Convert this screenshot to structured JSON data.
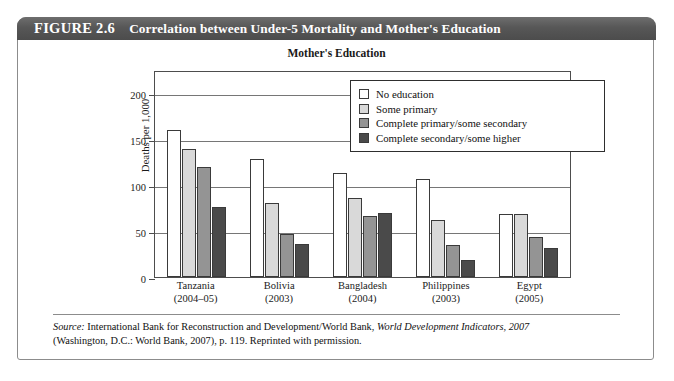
{
  "figure": {
    "label": "FIGURE 2.6",
    "title": "Correlation between Under-5 Mortality and Mother's Education"
  },
  "source": {
    "prefix": "Source:",
    "line1_a": " International Bank for Reconstruction and Development/World Bank, ",
    "line1_italic": "World Development Indicators, 2007",
    "line2": "(Washington, D.C.: World Bank, 2007), p. 119. Reprinted with permission."
  },
  "colors": {
    "header_bar": "#575757",
    "series_no_education": "#ffffff",
    "series_some_primary": "#d9d9d9",
    "series_complete_primary": "#949494",
    "series_complete_secondary": "#4a4a4a",
    "grid": "#767676",
    "axis": "#4d4d4d"
  },
  "chart_data": {
    "type": "bar",
    "title": "Mother's Education",
    "xlabel": "",
    "ylabel": "Deaths per 1,000 live births",
    "ylabel_line1": "Deaths per 1,000",
    "ylabel_line2": "live births",
    "ylim": [
      0,
      225
    ],
    "yticks": [
      0,
      50,
      100,
      150,
      200
    ],
    "ytick_labels": [
      "0",
      "50",
      "100",
      "150",
      "200"
    ],
    "grid": true,
    "legend_position": "top-right-inside",
    "categories": [
      "Tanzania",
      "Bolivia",
      "Bangladesh",
      "Philippines",
      "Egypt"
    ],
    "category_years": [
      "(2004–05)",
      "(2003)",
      "(2004)",
      "(2003)",
      "(2005)"
    ],
    "series": [
      {
        "name": "No education",
        "values": [
          160,
          128,
          113,
          107,
          69
        ]
      },
      {
        "name": "Some primary",
        "values": [
          139,
          80,
          86,
          62,
          69
        ]
      },
      {
        "name": "Complete primary/some secondary",
        "values": [
          120,
          47,
          66,
          35,
          43
        ]
      },
      {
        "name": "Complete secondary/some higher",
        "values": [
          76,
          36,
          70,
          18,
          31
        ]
      }
    ]
  }
}
